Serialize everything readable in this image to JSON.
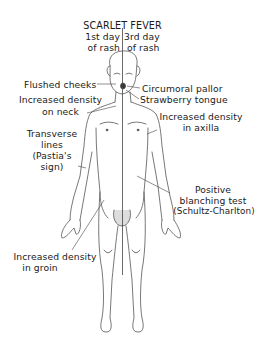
{
  "title": "SCARLET FEVER",
  "columns": {
    "left": {
      "line1": "1st day",
      "line2": "of rash"
    },
    "right": {
      "line1": "3rd day",
      "line2": "of rash"
    }
  },
  "labels": {
    "flushed_cheeks": "Flushed cheeks",
    "circumoral_pallor": "Circumoral pallor",
    "strawberry_tongue": "Strawberry tongue",
    "neck": {
      "line1": "Increased density",
      "line2": "on neck"
    },
    "axilla": {
      "line1": "Increased density",
      "line2": "in axilla"
    },
    "pastia": {
      "line1": "Transverse",
      "line2": "lines",
      "line3": "(Pastia's",
      "line4": "sign)"
    },
    "blanching": {
      "line1": "Positive",
      "line2": "blanching test",
      "line3": "(Schultz-Charlton)"
    },
    "groin": {
      "line1": "Increased density",
      "line2": "in groin"
    }
  },
  "colors": {
    "ink": "#1a1a1a",
    "figure": "#444444",
    "background": "#ffffff"
  }
}
